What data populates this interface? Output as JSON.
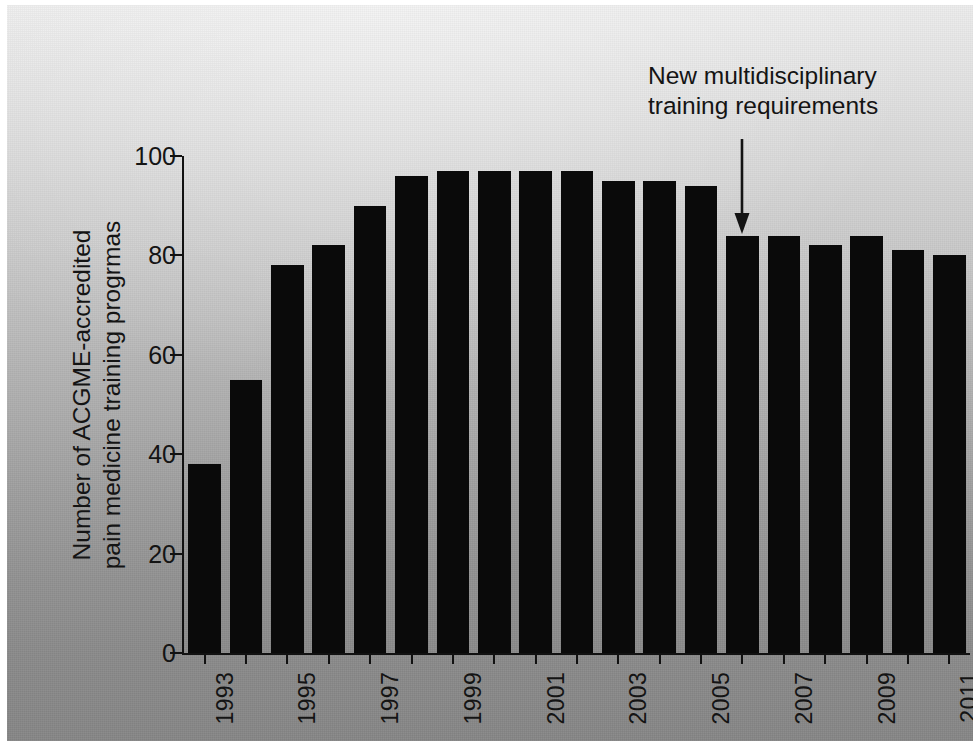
{
  "chart_data": {
    "type": "bar",
    "title": "",
    "subtitle": "",
    "xlabel": "",
    "ylabel": "Number of ACGME-accredited pain medicine progrmas",
    "ylabel_lines": [
      "Number of ACGME-accredited",
      "pain medicine training progrmas"
    ],
    "categories": [
      "1993",
      "1994",
      "1995",
      "1996",
      "1997",
      "1998",
      "1999",
      "2000",
      "2001",
      "2002",
      "2003",
      "2004",
      "2005",
      "2006",
      "2007",
      "2008",
      "2009",
      "2010",
      "2011"
    ],
    "values": [
      38,
      55,
      78,
      82,
      90,
      96,
      97,
      97,
      97,
      97,
      95,
      95,
      94,
      84,
      84,
      82,
      84,
      81,
      80
    ],
    "ylim": [
      0,
      100
    ],
    "yticks": [
      0,
      20,
      40,
      60,
      80,
      100
    ],
    "ytick_labels": [
      "0",
      "20",
      "40",
      "60",
      "80",
      "100"
    ],
    "xtick_labels": [
      "1993",
      "1995",
      "1997",
      "1999",
      "2001",
      "2003",
      "2005",
      "2007",
      "2009",
      "2011"
    ],
    "xtick_label_rotation": "90",
    "grid": false,
    "legend": false,
    "legend_position": "none",
    "bar_color": "#0a0a0a",
    "axis_color": "#111111",
    "text_color": "#141414",
    "background_color": "#b0b0b0",
    "annotations": [
      {
        "id": "new-requirements",
        "lines": [
          "New multidisciplinary",
          "training requirements"
        ],
        "text": "New multidisciplinary training requirements",
        "points_to_category": "2006",
        "points_to_value": 84,
        "arrow": "down-arrow"
      }
    ]
  }
}
